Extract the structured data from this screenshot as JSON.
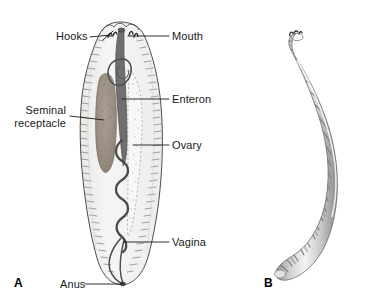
{
  "figure": {
    "background_color": "#ffffff",
    "line_color": "#1a1a1a",
    "body_fill": "#f2f2f0",
    "organ_fill": "#9c9184",
    "enteron_fill": "#6f6f70"
  },
  "panels": [
    {
      "id": "A",
      "letter": "A",
      "description": "Dorsal dissection view of leech showing internal organs"
    },
    {
      "id": "B",
      "letter": "B",
      "description": "Whole body lateral view of curved annulated leech"
    }
  ],
  "labels": [
    {
      "id": "hooks",
      "text": "Hooks",
      "side": "left"
    },
    {
      "id": "mouth",
      "text": "Mouth",
      "side": "right"
    },
    {
      "id": "seminal-receptacle",
      "text": "Seminal receptacle",
      "line1": "Seminal",
      "line2": "receptacle",
      "side": "left"
    },
    {
      "id": "enteron",
      "text": "Enteron",
      "side": "right"
    },
    {
      "id": "ovary",
      "text": "Ovary",
      "side": "right"
    },
    {
      "id": "vagina",
      "text": "Vagina",
      "side": "right"
    },
    {
      "id": "anus",
      "text": "Anus",
      "side": "left"
    }
  ]
}
